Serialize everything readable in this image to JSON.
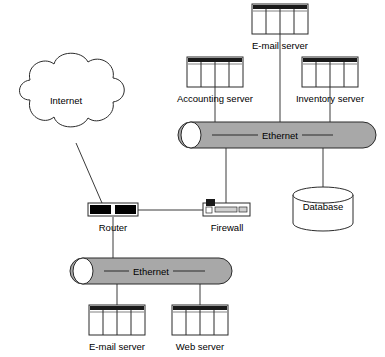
{
  "diagram": {
    "background_color": "#ffffff",
    "line_color": "#3a3a3a",
    "bus_fill_color": "#a8a8a8",
    "bus_stroke_color": "#2b2b2b",
    "server_header_color": "#1a1a1a",
    "router_body_color": "#000000",
    "cloud": {
      "label": "Internet",
      "icon": "cloud-icon",
      "cx": 65,
      "cy": 100
    },
    "buses": [
      {
        "id": "ethernet-top",
        "label": "Ethernet",
        "icon": "bus-cylinder-icon",
        "x": 178,
        "y": 122,
        "width": 198,
        "height": 26
      },
      {
        "id": "ethernet-bottom",
        "label": "Ethernet",
        "icon": "bus-cylinder-icon",
        "x": 70,
        "y": 258,
        "width": 162,
        "height": 26
      }
    ],
    "servers": [
      {
        "id": "email-server-top",
        "label": "E-mail server",
        "icon": "server-icon",
        "x": 252,
        "y": 4,
        "width": 56,
        "height": 30,
        "label_x": 280,
        "label_y": 45
      },
      {
        "id": "accounting-server",
        "label": "Accounting server",
        "icon": "server-icon",
        "x": 187,
        "y": 57,
        "width": 56,
        "height": 30,
        "label_x": 215,
        "label_y": 98
      },
      {
        "id": "inventory-server",
        "label": "Inventory server",
        "icon": "server-icon",
        "x": 302,
        "y": 57,
        "width": 56,
        "height": 30,
        "label_x": 330,
        "label_y": 98
      },
      {
        "id": "email-server-bottom",
        "label": "E-mail server",
        "icon": "server-icon",
        "x": 89,
        "y": 305,
        "width": 56,
        "height": 30,
        "label_x": 117,
        "label_y": 346
      },
      {
        "id": "web-server",
        "label": "Web server",
        "icon": "server-icon",
        "x": 172,
        "y": 305,
        "width": 56,
        "height": 30,
        "label_x": 200,
        "label_y": 346
      }
    ],
    "devices": [
      {
        "id": "router",
        "label": "Router",
        "icon": "router-icon",
        "x": 88,
        "y": 203,
        "width": 50,
        "height": 13,
        "label_x": 113,
        "label_y": 227
      },
      {
        "id": "firewall",
        "label": "Firewall",
        "icon": "firewall-icon",
        "x": 203,
        "y": 203,
        "width": 47,
        "height": 13,
        "label_x": 227,
        "label_y": 227
      }
    ],
    "database": {
      "id": "database",
      "label": "Database",
      "icon": "database-cylinder-icon",
      "cx": 323,
      "cy": 203,
      "rx": 30,
      "ry": 8,
      "body_height": 28
    },
    "connections": [
      {
        "id": "internet-to-router",
        "from": "Internet",
        "to": "Router"
      },
      {
        "id": "router-to-firewall",
        "from": "Router",
        "to": "Firewall"
      },
      {
        "id": "firewall-to-ethernet-top",
        "from": "Firewall",
        "to": "Ethernet (top)"
      },
      {
        "id": "router-to-ethernet-bottom",
        "from": "Router",
        "to": "Ethernet (bottom)"
      },
      {
        "id": "email-top-to-ethernet-top",
        "from": "E-mail server",
        "to": "Ethernet (top)"
      },
      {
        "id": "accounting-to-ethernet-top",
        "from": "Accounting server",
        "to": "Ethernet (top)"
      },
      {
        "id": "inventory-to-ethernet-top",
        "from": "Inventory server",
        "to": "Ethernet (top)"
      },
      {
        "id": "database-to-ethernet-top",
        "from": "Database",
        "to": "Ethernet (top)"
      },
      {
        "id": "email-bottom-to-ethernet-bottom",
        "from": "E-mail server",
        "to": "Ethernet (bottom)"
      },
      {
        "id": "web-to-ethernet-bottom",
        "from": "Web server",
        "to": "Ethernet (bottom)"
      }
    ]
  }
}
